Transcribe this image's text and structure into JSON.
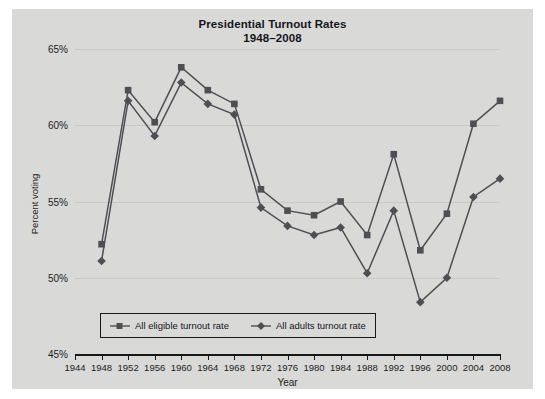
{
  "chart_data": {
    "type": "line",
    "title": "Presidential Turnout Rates",
    "subtitle": "1948–2008",
    "xlabel": "Year",
    "ylabel": "Percent voting",
    "grid": true,
    "legend_position": "bottom-left-inside",
    "xlim": [
      1944,
      2008
    ],
    "ylim": [
      45,
      65
    ],
    "ytick_labels": [
      "65%",
      "60%",
      "55%",
      "50%",
      "45%"
    ],
    "yticks": [
      65,
      60,
      55,
      50,
      45
    ],
    "x": [
      1944,
      1948,
      1952,
      1956,
      1960,
      1964,
      1968,
      1972,
      1976,
      1980,
      1984,
      1988,
      1992,
      1996,
      2000,
      2004,
      2008
    ],
    "xtick_labels": [
      "1944",
      "1948",
      "1952",
      "1956",
      "1960",
      "1964",
      "1968",
      "1972",
      "1976",
      "1980",
      "1984",
      "1988",
      "1992",
      "1996",
      "2000",
      "2004",
      "2008"
    ],
    "categories": [
      1948,
      1952,
      1956,
      1960,
      1964,
      1968,
      1972,
      1976,
      1980,
      1984,
      1988,
      1992,
      1996,
      2000,
      2004,
      2008
    ],
    "series": [
      {
        "name": "All eligible turnout rate",
        "marker": "square",
        "color": "#4e4f53",
        "values": [
          52.2,
          62.3,
          60.2,
          63.8,
          62.3,
          61.4,
          55.8,
          54.4,
          54.1,
          55.0,
          52.8,
          58.1,
          51.8,
          54.2,
          60.1,
          61.6
        ]
      },
      {
        "name": "All adults turnout rate",
        "marker": "diamond",
        "color": "#4e4f53",
        "values": [
          51.1,
          61.6,
          59.3,
          62.8,
          61.4,
          60.7,
          54.6,
          53.4,
          52.8,
          53.3,
          50.3,
          54.4,
          48.4,
          50.0,
          55.3,
          56.5
        ]
      }
    ]
  },
  "style": {
    "panel_bg": "#d9d9d8",
    "page_bg": "#ffffff",
    "axis_color": "#16171b",
    "grid_color": "#c9c9c8",
    "line_color": "#4e4f53",
    "text_color": "#15161a"
  },
  "icons": {
    "eligible_marker": "square-marker-icon",
    "adults_marker": "diamond-marker-icon"
  }
}
